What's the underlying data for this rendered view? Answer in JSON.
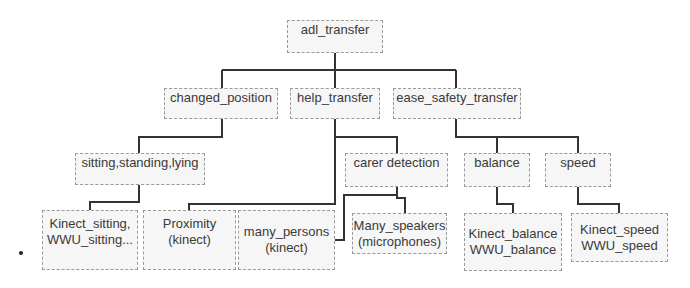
{
  "diagram": {
    "type": "tree",
    "colors": {
      "line": "#333333",
      "box_border": "#9a9a9a",
      "box_fill": "#f6f6f6",
      "text": "#3a3a3a"
    },
    "root": {
      "label": "adl_transfer"
    },
    "level1": [
      {
        "id": "changed_position",
        "label": "changed_position"
      },
      {
        "id": "help_transfer",
        "label": "help_transfer"
      },
      {
        "id": "ease_safety_transfer",
        "label": "ease_safety_transfer"
      }
    ],
    "level2": [
      {
        "id": "sitting",
        "label": "sitting,standing,lying",
        "parent": "changed_position"
      },
      {
        "id": "carer_detection",
        "label": "carer detection",
        "parent": "help_transfer"
      },
      {
        "id": "balance",
        "label": "balance",
        "parent": "ease_safety_transfer"
      },
      {
        "id": "speed",
        "label": "speed",
        "parent": "ease_safety_transfer"
      }
    ],
    "leaves": [
      {
        "id": "kinect_sitting",
        "lines": [
          "Kinect_sitting,",
          "WWU_sitting..."
        ],
        "parent": "sitting"
      },
      {
        "id": "proximity",
        "lines": [
          "Proximity",
          "(kinect)"
        ],
        "parent": "help_transfer"
      },
      {
        "id": "many_persons",
        "lines": [
          "many_persons",
          "(kinect)"
        ],
        "parent": "carer_detection"
      },
      {
        "id": "many_speakers",
        "lines": [
          "Many_speakers",
          "(microphones)"
        ],
        "parent": "carer_detection"
      },
      {
        "id": "kinect_balance",
        "lines": [
          "Kinect_balance",
          "WWU_balance"
        ],
        "parent": "balance"
      },
      {
        "id": "kinect_speed",
        "lines": [
          "Kinect_speed",
          "WWU_speed"
        ],
        "parent": "speed"
      }
    ]
  }
}
